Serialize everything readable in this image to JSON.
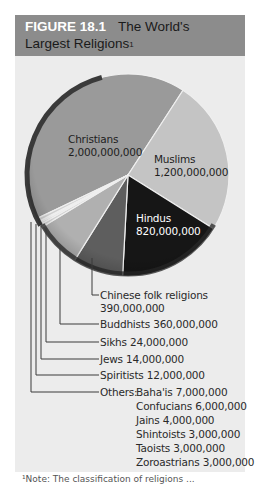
{
  "title": {
    "figure_number": "FIGURE 18.1",
    "line1": "The World's",
    "line2": "Largest Religions",
    "superscript": "1"
  },
  "colors": {
    "title_bar": "#8c8c8c",
    "panel": "#ececec",
    "christians": "#9a9a9a",
    "muslims": "#c4c4c4",
    "hindus": "#161616",
    "chinese_folk": "#5e5e5e",
    "buddhists": "#b0b0b0",
    "small": "#d0d0d0",
    "rim": "#3a3a3a"
  },
  "pie_labels": {
    "christians": {
      "name": "Christians",
      "value": "2,000,000,000"
    },
    "muslims": {
      "name": "Muslims",
      "value": "1,200,000,000"
    },
    "hindus": {
      "name": "Hindus",
      "value": "820,000,000"
    }
  },
  "callouts": {
    "chinese_name": "Chinese folk religions",
    "chinese_value": "390,000,000",
    "buddhists": "Buddhists 360,000,000",
    "sikhs": "Sikhs 24,000,000",
    "jews": "Jews 14,000,000",
    "spiritists": "Spiritists 12,000,000",
    "others_prefix": "Others:",
    "others": [
      "Baha'is 7,000,000",
      "Confucians 6,000,000",
      "Jains 4,000,000",
      "Shintoists 3,000,000",
      "Taoists 3,000,000",
      "Zoroastrians 3,000,000"
    ]
  },
  "footnote": "¹Note: The classification of religions ...",
  "chart_data": {
    "type": "pie",
    "categories": [
      "Christians",
      "Muslims",
      "Hindus",
      "Chinese folk religions",
      "Buddhists",
      "Sikhs",
      "Jews",
      "Spiritists",
      "Others"
    ],
    "values": [
      2000000000,
      1200000000,
      820000000,
      390000000,
      360000000,
      24000000,
      14000000,
      12000000,
      26000000
    ],
    "others_breakdown": {
      "Baha'is": 7000000,
      "Confucians": 6000000,
      "Jains": 4000000,
      "Shintoists": 3000000,
      "Taoists": 3000000,
      "Zoroastrians": 3000000
    },
    "legend": "callout labels with leader lines",
    "xlabel": "",
    "ylabel": ""
  }
}
